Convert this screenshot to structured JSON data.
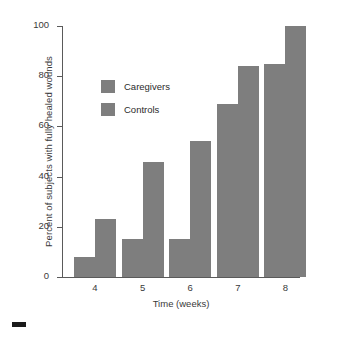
{
  "chart_data": {
    "type": "bar",
    "title": "",
    "xlabel": "Time (weeks)",
    "ylabel": "Percent of subjects with fully healed wounds",
    "categories": [
      "4",
      "5",
      "6",
      "7",
      "8"
    ],
    "series": [
      {
        "name": "Caregivers",
        "values": [
          8,
          15,
          15,
          69,
          85
        ],
        "color": "#7e7e7e"
      },
      {
        "name": "Controls",
        "values": [
          23,
          46,
          54,
          84,
          100
        ],
        "color": "#7e7e7e"
      }
    ],
    "ylim": [
      0,
      100
    ],
    "yticks": [
      "0",
      "20",
      "40",
      "60",
      "80",
      "100"
    ],
    "ytick_values": [
      0,
      20,
      40,
      60,
      80,
      100
    ],
    "grid": false,
    "legend_position": "upper-left-inside"
  },
  "legend": {
    "items": [
      {
        "label": "Caregivers"
      },
      {
        "label": "Controls"
      }
    ]
  },
  "figure": {
    "background_color": "#ffffff",
    "axis_color": "#5a5a5a",
    "bar_color": "#7e7e7e",
    "corner_mark_color": "#1a1a1a"
  }
}
